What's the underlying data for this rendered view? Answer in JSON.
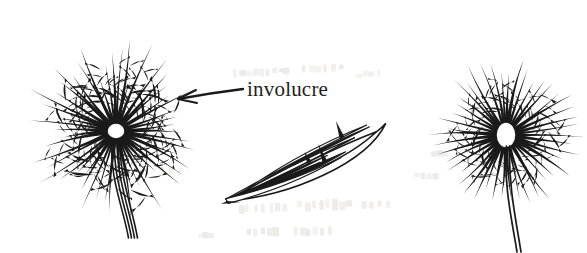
{
  "figure": {
    "kind": "botanical-line-drawing",
    "caption_label": "involucre",
    "width": 587,
    "height": 253,
    "background_color": "#ffffff",
    "ink_color": "#1a1a1a",
    "text_color": "#231f20",
    "bleed_color": "#e9e7e4"
  },
  "annotation": {
    "label": "involucre",
    "label_x": 247,
    "label_y": 96,
    "font_size": 21,
    "leader": {
      "tail_x": 243,
      "tail_y": 89,
      "tip_x": 178,
      "tip_y": 99,
      "stroke_width": 2.4,
      "head_upper_x": 196,
      "head_upper_y": 90,
      "head_lower_x": 197,
      "head_lower_y": 103
    }
  },
  "specimens": [
    {
      "name": "left-involucre-head",
      "view": "face-on radiate head",
      "center_x": 116,
      "center_y": 131,
      "receptacle_rx": 9,
      "receptacle_ry": 8,
      "ray_count": 54,
      "ray_len_min": 52,
      "ray_len_max": 96,
      "ray_width": 1.5,
      "barb_count": 3,
      "seed": 11,
      "has_stalk": true,
      "stalk": {
        "count": 4,
        "x": 116,
        "y": 139,
        "end_x": 133,
        "end_y": 238,
        "spread": 9,
        "width": 1.6
      }
    },
    {
      "name": "center-involucre-lateral",
      "view": "lateral closed bud",
      "center_x": 305,
      "center_y": 163,
      "base_x": 227,
      "base_y": 201,
      "apex_x": 383,
      "apex_y": 118,
      "blade_count": 7,
      "blade_width": 1.6,
      "seed": 29
    },
    {
      "name": "right-involucre-head",
      "view": "globose head on stalk",
      "center_x": 506,
      "center_y": 135,
      "receptacle_rx": 10,
      "receptacle_ry": 13,
      "ray_count": 46,
      "ray_len_min": 58,
      "ray_len_max": 80,
      "ray_width": 1.6,
      "barb_count": 2,
      "seed": 47,
      "has_stalk": true,
      "stalk": {
        "count": 2,
        "x": 508,
        "y": 146,
        "end_x": 519,
        "end_y": 252,
        "spread": 4,
        "width": 1.7
      }
    }
  ],
  "bleed_through": {
    "note": "faint reverse-page show-through",
    "marks": [
      {
        "x": 232,
        "y": 68,
        "w": 60,
        "h": 9,
        "rot": -2
      },
      {
        "x": 300,
        "y": 64,
        "w": 44,
        "h": 10,
        "rot": -1
      },
      {
        "x": 355,
        "y": 70,
        "w": 26,
        "h": 8,
        "rot": -2
      },
      {
        "x": 237,
        "y": 203,
        "w": 52,
        "h": 11,
        "rot": -2
      },
      {
        "x": 296,
        "y": 199,
        "w": 58,
        "h": 12,
        "rot": -2
      },
      {
        "x": 360,
        "y": 200,
        "w": 30,
        "h": 9,
        "rot": -1
      },
      {
        "x": 246,
        "y": 227,
        "w": 34,
        "h": 10,
        "rot": -1
      },
      {
        "x": 292,
        "y": 226,
        "w": 40,
        "h": 10,
        "rot": -1
      },
      {
        "x": 160,
        "y": 166,
        "w": 22,
        "h": 7,
        "rot": 0
      },
      {
        "x": 412,
        "y": 172,
        "w": 26,
        "h": 8,
        "rot": -1
      },
      {
        "x": 430,
        "y": 150,
        "w": 18,
        "h": 7,
        "rot": 0
      },
      {
        "x": 196,
        "y": 232,
        "w": 18,
        "h": 7,
        "rot": 0
      }
    ]
  }
}
